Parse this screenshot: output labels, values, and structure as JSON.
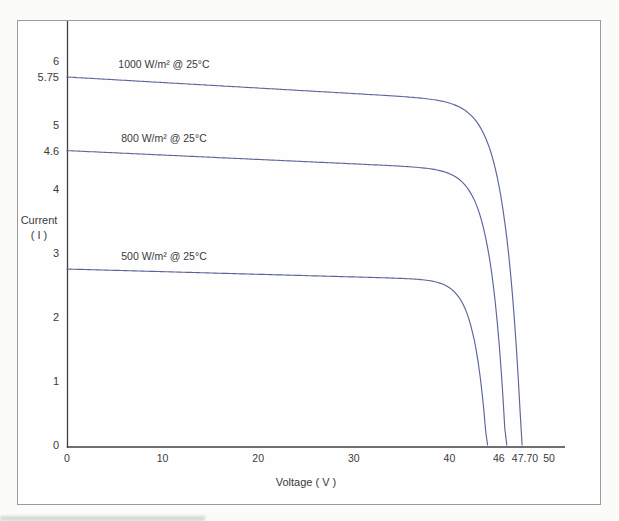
{
  "chart_data": {
    "type": "line",
    "title": "",
    "xlabel": "Voltage ( V )",
    "ylabel_lines": [
      "Current",
      "( I )"
    ],
    "xlim": [
      0,
      52
    ],
    "ylim": [
      0,
      6.6
    ],
    "grid": false,
    "legend_position": "inline-curve-labels",
    "x_ticks": [
      {
        "v": 0,
        "label": "0"
      },
      {
        "v": 10,
        "label": "10"
      },
      {
        "v": 20,
        "label": "20"
      },
      {
        "v": 30,
        "label": "30"
      },
      {
        "v": 40,
        "label": "40"
      },
      {
        "v": 46,
        "label": "46"
      },
      {
        "v": 47.7,
        "label": "47.70"
      },
      {
        "v": 50,
        "label": "50"
      }
    ],
    "y_ticks": [
      {
        "v": 0,
        "label": "0"
      },
      {
        "v": 1,
        "label": "1"
      },
      {
        "v": 2,
        "label": "2"
      },
      {
        "v": 3,
        "label": "3"
      },
      {
        "v": 4,
        "label": "4"
      },
      {
        "v": 4.6,
        "label": "4.6"
      },
      {
        "v": 5,
        "label": "5"
      },
      {
        "v": 5.75,
        "label": "5.75"
      },
      {
        "v": 6,
        "label": "6"
      }
    ],
    "colors": {
      "line": "#5b659b",
      "axis": "#3f3f3f",
      "text": "#3a3a3a",
      "frame": "#9b9b9b"
    },
    "series": [
      {
        "id": "1000wm2",
        "label": "1000 W/m² @ 25°C",
        "isc": 5.75,
        "voc": 47.7,
        "curve_shape": {
          "vt": 1.7,
          "droop": 0.0015
        },
        "points": [
          [
            0,
            5.75
          ],
          [
            10,
            5.67
          ],
          [
            20,
            5.58
          ],
          [
            30,
            5.48
          ],
          [
            38,
            5.33
          ],
          [
            40,
            5.26
          ],
          [
            43,
            5.0
          ],
          [
            45,
            4.5
          ],
          [
            46,
            3.7
          ],
          [
            47,
            2.0
          ],
          [
            47.7,
            0
          ]
        ]
      },
      {
        "id": "800wm2",
        "label": "800 W/m² @ 25°C",
        "isc": 4.6,
        "voc": 46,
        "curve_shape": {
          "vt": 1.5,
          "droop": 0.0015
        },
        "points": [
          [
            0,
            4.6
          ],
          [
            10,
            4.53
          ],
          [
            20,
            4.46
          ],
          [
            30,
            4.37
          ],
          [
            38,
            4.2
          ],
          [
            41,
            3.95
          ],
          [
            43,
            3.55
          ],
          [
            44.5,
            2.9
          ],
          [
            45.5,
            1.5
          ],
          [
            46,
            0
          ]
        ]
      },
      {
        "id": "500wm2",
        "label": "500 W/m² @ 25°C",
        "isc": 2.75,
        "voc": 44,
        "curve_shape": {
          "vt": 1.3,
          "droop": 0.0015
        },
        "points": [
          [
            0,
            2.75
          ],
          [
            10,
            2.71
          ],
          [
            20,
            2.66
          ],
          [
            30,
            2.58
          ],
          [
            36,
            2.46
          ],
          [
            39,
            2.3
          ],
          [
            41,
            2.0
          ],
          [
            42.5,
            1.45
          ],
          [
            43.5,
            0.6
          ],
          [
            44,
            0
          ]
        ]
      }
    ]
  }
}
